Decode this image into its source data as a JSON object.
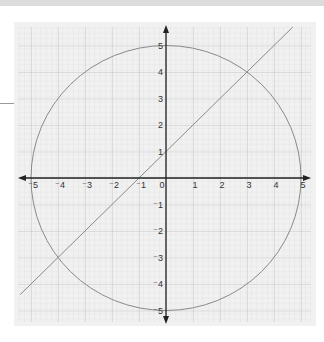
{
  "chart_data": {
    "type": "line",
    "title": "",
    "xlabel": "",
    "ylabel": "",
    "xlim": [
      -5,
      5
    ],
    "ylim": [
      -5,
      5
    ],
    "grid": true,
    "x_ticks": [
      "⁻5",
      "⁻4",
      "⁻3",
      "⁻2",
      "⁻1",
      "0",
      "1",
      "2",
      "3",
      "4",
      "5"
    ],
    "y_ticks": [
      "5",
      "4",
      "3",
      "2",
      "1",
      "⁻1",
      "⁻2",
      "⁻3",
      "⁻4",
      "⁻5"
    ],
    "series": [
      {
        "name": "circle",
        "equation": "x^2 + y^2 = 25",
        "center": [
          0,
          0
        ],
        "radius": 5,
        "color": "#8a8a8a"
      },
      {
        "name": "line",
        "equation": "y = x + 1",
        "x": [
          -5.4,
          4.7
        ],
        "y": [
          -4.4,
          5.7
        ],
        "color": "#8a8a8a"
      }
    ],
    "intersections": [
      [
        3,
        4
      ],
      [
        -4,
        -3
      ]
    ],
    "axis_color": "#222222",
    "grid_color": "#c8c8c8"
  }
}
